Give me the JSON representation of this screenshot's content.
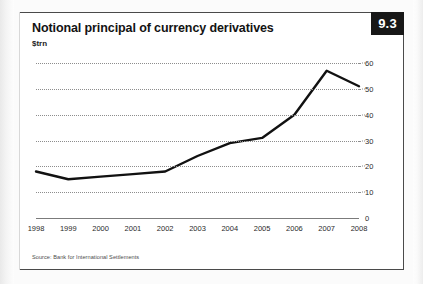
{
  "badge": {
    "number": "9.3"
  },
  "header": {
    "title": "Notional principal of currency derivatives",
    "subtitle": "$trn"
  },
  "footer": {
    "source": "Source: Bank for International Settlements"
  },
  "chart_data": {
    "type": "line",
    "title": "Notional principal of currency derivatives",
    "subtitle": "$trn",
    "xlabel": "",
    "ylabel": "$trn",
    "categories": [
      "1998",
      "1999",
      "2000",
      "2001",
      "2002",
      "2003",
      "2004",
      "2005",
      "2006",
      "2007",
      "2008"
    ],
    "values": [
      18,
      15,
      16,
      17,
      18,
      24,
      29,
      31,
      40,
      57,
      51
    ],
    "series": [
      {
        "name": "Notional principal of currency derivatives",
        "values": [
          18,
          15,
          16,
          17,
          18,
          24,
          29,
          31,
          40,
          57,
          51
        ]
      }
    ],
    "ylim": [
      0,
      60
    ],
    "yticks": [
      0,
      10,
      20,
      30,
      40,
      50,
      60
    ],
    "ytick_labels": [
      "0",
      "10",
      "20",
      "30",
      "40",
      "50",
      "60"
    ],
    "y_axis_position": "right",
    "grid": "horizontal-dotted",
    "legend": "none",
    "line_color": "#111111",
    "source": "Source: Bank for International Settlements"
  }
}
